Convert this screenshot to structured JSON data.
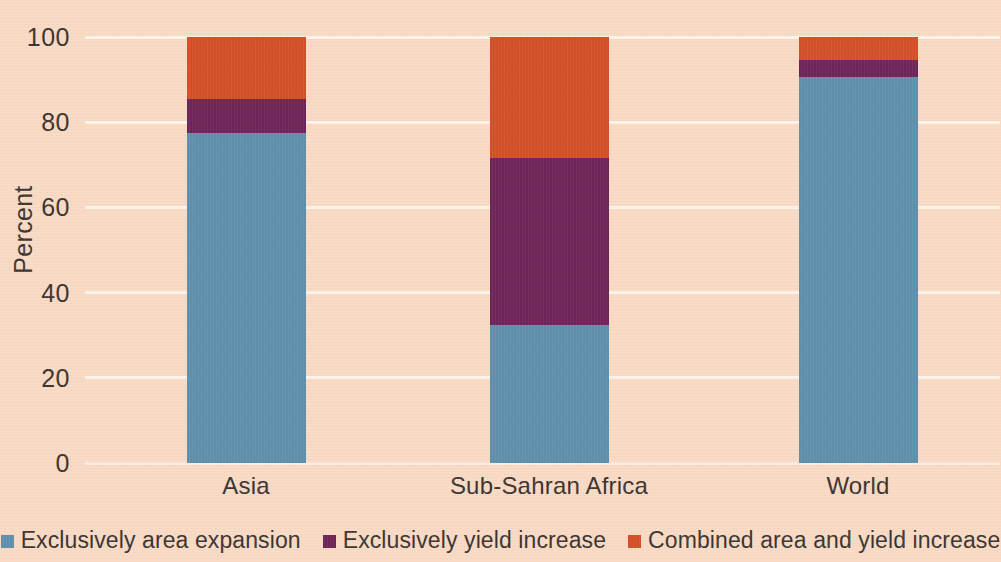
{
  "chart_data": {
    "type": "bar",
    "subtype": "stacked-bar-100",
    "title": "",
    "xlabel": "",
    "ylabel": "Percent",
    "ylim": [
      0,
      100
    ],
    "yticks": [
      0,
      20,
      40,
      60,
      80,
      100
    ],
    "ytick_labels": [
      "0",
      "20",
      "40",
      "60",
      "80",
      "100"
    ],
    "grid": true,
    "legend_position": "bottom",
    "categories": [
      "Asia",
      "Sub-Sahran Africa",
      "World"
    ],
    "series": [
      {
        "name": "Exclusively area expansion",
        "color": "#5e90ad",
        "values": [
          77.5,
          32.4,
          90.6
        ]
      },
      {
        "name": "Exclusively yield increase",
        "color": "#6d2458",
        "values": [
          8.0,
          39.1,
          4.0
        ]
      },
      {
        "name": "Combined area and yield increase",
        "color": "#d24f28",
        "values": [
          14.5,
          28.5,
          5.4
        ]
      }
    ]
  },
  "colors": {
    "background": "#f9dac4",
    "gridline": "#fdf3ea",
    "text": "#3a3330",
    "series_blue": "#5e90ad",
    "series_purple": "#6d2458",
    "series_orange": "#d24f28"
  },
  "axis": {
    "y_title": "Percent",
    "y_ticks": [
      "100",
      "80",
      "60",
      "40",
      "20",
      "0"
    ],
    "x_ticks": [
      "Asia",
      "Sub-Sahran Africa",
      "World"
    ]
  },
  "legend": {
    "items": [
      {
        "label": "Exclusively area expansion",
        "color": "#5e90ad"
      },
      {
        "label": "Exclusively yield increase",
        "color": "#6d2458"
      },
      {
        "label": "Combined area and yield increase",
        "color": "#d24f28"
      }
    ]
  }
}
